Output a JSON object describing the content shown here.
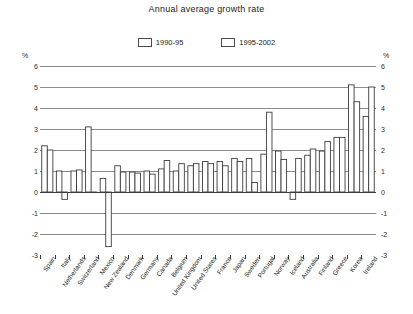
{
  "chart_data": {
    "type": "bar",
    "title": "Annual average growth rate",
    "xlabel": "",
    "ylabel": "%",
    "yunit_left": "%",
    "yunit_right": "%",
    "ylim": [
      -3,
      6
    ],
    "yticks": [
      6,
      5,
      4,
      3,
      2,
      1,
      0,
      -1,
      -2,
      -3
    ],
    "ytick_labels": [
      "6",
      "5",
      "4",
      "3",
      "2",
      "1",
      "0",
      "-1",
      "-2",
      "-3"
    ],
    "grid": true,
    "legend_position": "top-center",
    "categories": [
      "Spain",
      "Italy",
      "Netherlands",
      "Switzerland",
      "Mexico",
      "New Zealand",
      "Denmark",
      "Germany",
      "Canada",
      "Belgium",
      "United Kingdom",
      "United States",
      "France",
      "Japan",
      "Sweden",
      "Portugal",
      "Norway",
      "Iceland",
      "Australia",
      "Finland",
      "Greece",
      "Korea",
      "Ireland"
    ],
    "series": [
      {
        "name": "1990-95",
        "values": [
          2.2,
          1.0,
          1.0,
          3.1,
          0.65,
          1.25,
          0.95,
          1.0,
          1.1,
          1.0,
          1.25,
          1.45,
          1.45,
          1.6,
          1.6,
          1.8,
          1.95,
          -0.35,
          1.75,
          1.95,
          2.6,
          5.1,
          3.6
        ]
      },
      {
        "name": "1995-2002",
        "values": [
          2.0,
          -0.35,
          1.05,
          0.0,
          -2.6,
          0.95,
          0.9,
          0.85,
          1.5,
          1.35,
          1.35,
          1.35,
          1.25,
          1.45,
          0.45,
          3.8,
          1.55,
          1.6,
          2.05,
          2.4,
          2.6,
          4.3,
          5.0
        ]
      }
    ]
  },
  "legend": {
    "items": [
      {
        "label": "1990-95"
      },
      {
        "label": "1995-2002"
      }
    ]
  }
}
